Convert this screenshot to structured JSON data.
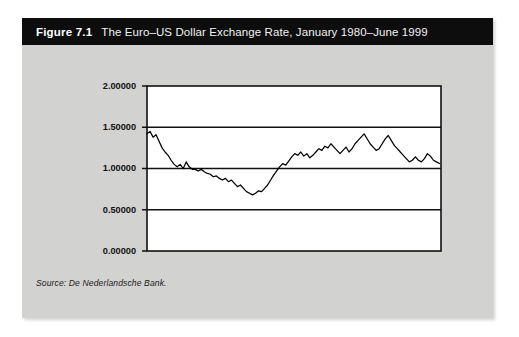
{
  "figure": {
    "number": "Figure 7.1",
    "title": "The Euro–US Dollar Exchange Rate, January 1980–June 1999",
    "source": "Source: De Nederlandsche Bank.",
    "card_background": "#d2d2d0",
    "title_bar_background": "#0d0d0d",
    "title_text_color": "#ffffff"
  },
  "chart_data": {
    "type": "line",
    "title": "The Euro–US Dollar Exchange Rate, January 1980–June 1999",
    "xlabel": "",
    "ylabel": "",
    "xlim": [
      1980.0,
      1999.5
    ],
    "ylim": [
      0.0,
      2.0
    ],
    "grid": true,
    "grid_axis": "y",
    "legend": false,
    "line_color": "#000000",
    "plot_background": "#ffffff",
    "ytick_labels": [
      "0.00000",
      "0.50000",
      "1.00000",
      "1.50000",
      "2.00000"
    ],
    "ytick_values": [
      0.0,
      0.5,
      1.0,
      1.5,
      2.0
    ],
    "xtick_labels": [],
    "series": [
      {
        "name": "Euro–US Dollar Exchange Rate",
        "x": [
          1980.0,
          1980.2,
          1980.4,
          1980.6,
          1980.8,
          1981.0,
          1981.2,
          1981.4,
          1981.6,
          1981.8,
          1982.0,
          1982.2,
          1982.4,
          1982.6,
          1982.8,
          1983.0,
          1983.2,
          1983.4,
          1983.6,
          1983.8,
          1984.0,
          1984.2,
          1984.4,
          1984.6,
          1984.8,
          1985.0,
          1985.2,
          1985.4,
          1985.6,
          1985.8,
          1986.0,
          1986.2,
          1986.4,
          1986.6,
          1986.8,
          1987.0,
          1987.2,
          1987.4,
          1987.6,
          1987.8,
          1988.0,
          1988.2,
          1988.4,
          1988.6,
          1988.8,
          1989.0,
          1989.2,
          1989.4,
          1989.6,
          1989.8,
          1990.0,
          1990.2,
          1990.4,
          1990.6,
          1990.8,
          1991.0,
          1991.2,
          1991.4,
          1991.6,
          1991.8,
          1992.0,
          1992.2,
          1992.4,
          1992.6,
          1992.8,
          1993.0,
          1993.2,
          1993.4,
          1993.6,
          1993.8,
          1994.0,
          1994.2,
          1994.4,
          1994.6,
          1994.8,
          1995.0,
          1995.2,
          1995.4,
          1995.6,
          1995.8,
          1996.0,
          1996.2,
          1996.4,
          1996.6,
          1996.8,
          1997.0,
          1997.2,
          1997.4,
          1997.6,
          1997.8,
          1998.0,
          1998.2,
          1998.4,
          1998.6,
          1998.8,
          1999.0,
          1999.2,
          1999.4
        ],
        "y": [
          1.42,
          1.45,
          1.38,
          1.41,
          1.33,
          1.25,
          1.2,
          1.16,
          1.1,
          1.05,
          1.02,
          1.05,
          1.0,
          1.08,
          1.02,
          0.99,
          0.99,
          0.97,
          0.99,
          0.96,
          0.94,
          0.93,
          0.9,
          0.91,
          0.88,
          0.86,
          0.88,
          0.84,
          0.86,
          0.82,
          0.78,
          0.8,
          0.76,
          0.72,
          0.7,
          0.68,
          0.7,
          0.73,
          0.72,
          0.76,
          0.8,
          0.86,
          0.92,
          0.97,
          1.02,
          1.06,
          1.04,
          1.09,
          1.14,
          1.18,
          1.16,
          1.2,
          1.15,
          1.18,
          1.13,
          1.16,
          1.2,
          1.24,
          1.22,
          1.27,
          1.25,
          1.3,
          1.26,
          1.22,
          1.18,
          1.22,
          1.26,
          1.2,
          1.24,
          1.3,
          1.34,
          1.38,
          1.42,
          1.36,
          1.3,
          1.26,
          1.22,
          1.24,
          1.3,
          1.36,
          1.4,
          1.34,
          1.28,
          1.24,
          1.2,
          1.16,
          1.12,
          1.08,
          1.1,
          1.14,
          1.1,
          1.08,
          1.12,
          1.18,
          1.15,
          1.1,
          1.08,
          1.06
        ]
      }
    ]
  }
}
